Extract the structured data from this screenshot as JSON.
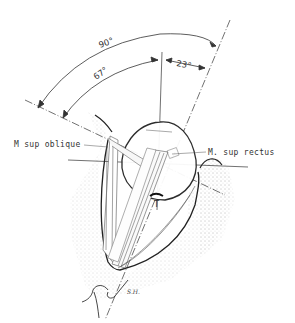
{
  "figure": {
    "type": "anatomical-diagram"
  },
  "angles": {
    "outer": "90°",
    "inner": "67°",
    "right": "23°"
  },
  "labels": {
    "sup_oblique": "M sup oblique",
    "sup_rectus": "M. sup rectus",
    "trochlea_marker": "T",
    "signature": "S.H."
  },
  "colors": {
    "line": "#333333",
    "stipple": "#bbbbbb",
    "background": "#ffffff"
  }
}
